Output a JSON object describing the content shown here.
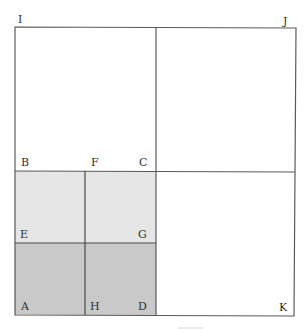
{
  "diagram": {
    "type": "geometric-squares",
    "colors": {
      "line": "#5a5a5a",
      "light_fill": "#e6e6e6",
      "dark_fill": "#c9c9c9",
      "background": "#ffffff"
    },
    "points": {
      "I": "I",
      "J": "J",
      "B": "B",
      "F": "F",
      "C": "C",
      "E": "E",
      "G": "G",
      "A": "A",
      "H": "H",
      "D": "D",
      "K": "K"
    }
  }
}
